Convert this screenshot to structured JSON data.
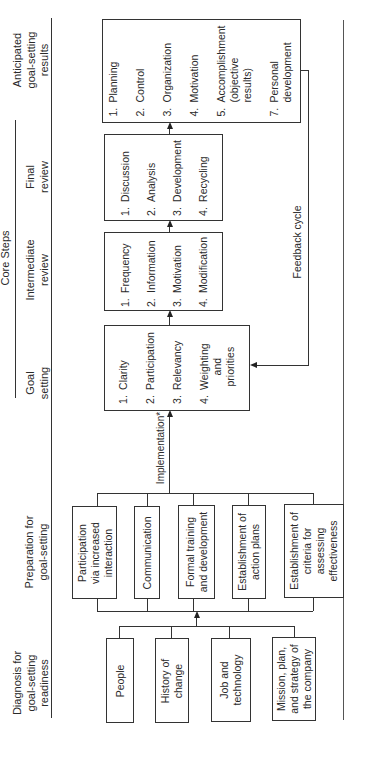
{
  "headers": {
    "core_steps": "Core Steps",
    "diagnosis": "Diagnosis for\ngoal-setting\nreadiness",
    "preparation": "Preparation for\ngoal-setting",
    "goal_setting": "Goal\nsetting",
    "intermediate_review": "Intermediate\nreview",
    "final_review": "Final\nreview",
    "anticipated_results": "Anticipated\ngoal-setting\nresults"
  },
  "diagnosis_boxes": [
    {
      "label": "People"
    },
    {
      "label": "History of\nchange"
    },
    {
      "label": "Job and\ntechnology"
    },
    {
      "label": "Mission, plan,\nand strategy of\nthe company"
    }
  ],
  "preparation_boxes": [
    {
      "label": "Participation\nvia increased\ninteraction"
    },
    {
      "label": "Communication"
    },
    {
      "label": "Formal training\nand development"
    },
    {
      "label": "Establishment of\naction plans"
    },
    {
      "label": "Establishment of\ncriteria for\nassessing\neffectiveness"
    }
  ],
  "connector_labels": {
    "implementation": "Implementation*",
    "feedback_cycle": "Feedback cycle"
  },
  "goal_setting_items": [
    {
      "num": "1.",
      "label": "Clarity"
    },
    {
      "num": "2.",
      "label": "Participation"
    },
    {
      "num": "3.",
      "label": "Relevancy"
    },
    {
      "num": "4.",
      "label": "Weighting\nand\npriorities"
    }
  ],
  "intermediate_review_items": [
    {
      "num": "1.",
      "label": "Frequency"
    },
    {
      "num": "2.",
      "label": "Information"
    },
    {
      "num": "3.",
      "label": "Motivation"
    },
    {
      "num": "4.",
      "label": "Modification"
    }
  ],
  "final_review_items": [
    {
      "num": "1.",
      "label": "Discussion"
    },
    {
      "num": "2.",
      "label": "Analysis"
    },
    {
      "num": "3.",
      "label": "Development"
    },
    {
      "num": "4.",
      "label": "Recycling"
    }
  ],
  "results_items": [
    {
      "num": "1.",
      "label": "Planning"
    },
    {
      "num": "2.",
      "label": "Control"
    },
    {
      "num": "3.",
      "label": "Organization"
    },
    {
      "num": "4.",
      "label": "Motivation"
    },
    {
      "num": "5.",
      "label": "Accomplishment\n(objective\nresults)"
    },
    {
      "num": "7.",
      "label": "Personal\ndevelopment"
    }
  ]
}
